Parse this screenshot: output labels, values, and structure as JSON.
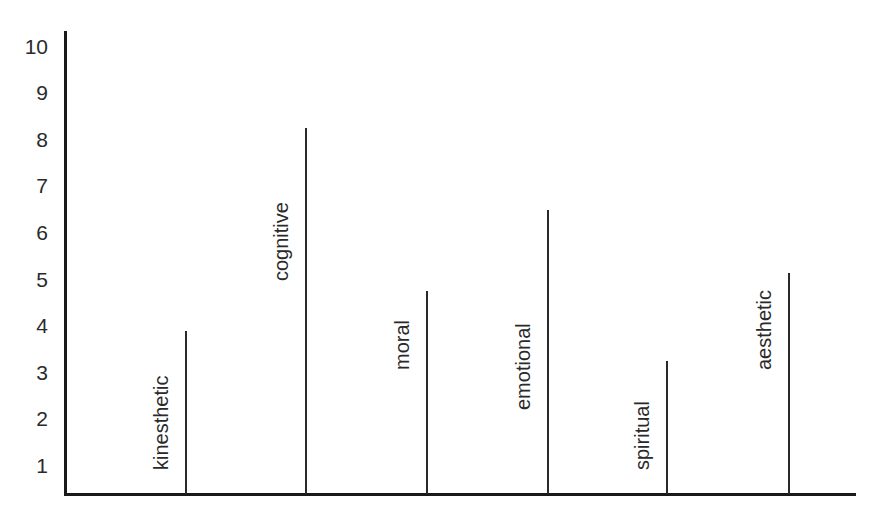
{
  "chart_data": {
    "type": "bar",
    "title": "",
    "xlabel": "",
    "ylabel": "",
    "ylim": [
      0,
      10
    ],
    "yticks": [
      1,
      2,
      3,
      4,
      5,
      6,
      7,
      8,
      9,
      10
    ],
    "grid": false,
    "legend": null,
    "style": "thin vertical lines (lollipop-style bars without heads), category labels written vertically beside each line",
    "categories": [
      "kinesthetic",
      "cognitive",
      "moral",
      "emotional",
      "spiritual",
      "aesthetic"
    ],
    "values": [
      3.9,
      8.25,
      4.75,
      6.5,
      3.25,
      5.15
    ]
  },
  "axis": {
    "y_tick_labels": [
      "1",
      "2",
      "3",
      "4",
      "5",
      "6",
      "7",
      "8",
      "9",
      "10"
    ]
  },
  "bars": [
    {
      "label": "kinesthetic",
      "value": 3.9,
      "x": 186,
      "label_bottom": 470
    },
    {
      "label": "cognitive",
      "value": 8.25,
      "x": 306,
      "label_bottom": 281
    },
    {
      "label": "moral",
      "value": 4.75,
      "x": 427,
      "label_bottom": 370
    },
    {
      "label": "emotional",
      "value": 6.5,
      "x": 548,
      "label_bottom": 410
    },
    {
      "label": "spiritual",
      "value": 3.25,
      "x": 667,
      "label_bottom": 470
    },
    {
      "label": "aesthetic",
      "value": 5.15,
      "x": 789,
      "label_bottom": 370
    }
  ],
  "colors": {
    "axis": "#1a1a1a",
    "bar": "#2a2a2a",
    "text": "#2a2a2a",
    "background": "#ffffff"
  }
}
